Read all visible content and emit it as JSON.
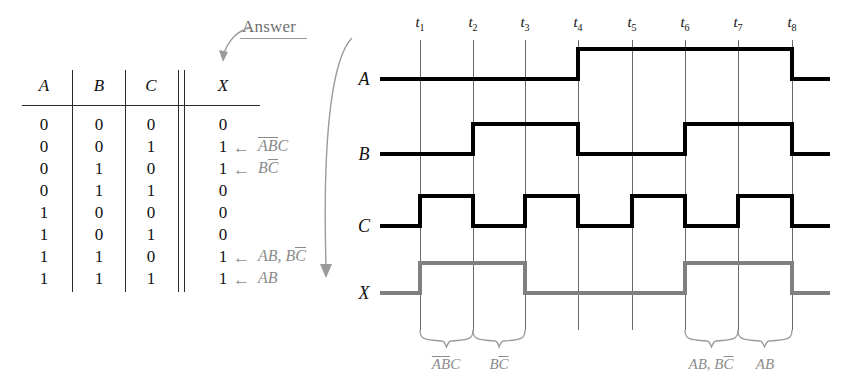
{
  "figure": {
    "kind": "truth-table-and-timing-diagram",
    "answer_callout": {
      "label": "Answer",
      "points_to": "X"
    }
  },
  "truth_table": {
    "columns": [
      "A",
      "B",
      "C",
      "X"
    ],
    "rows": [
      {
        "A": "0",
        "B": "0",
        "C": "0",
        "X": "0",
        "note": ""
      },
      {
        "A": "0",
        "B": "0",
        "C": "1",
        "X": "1",
        "note": "ABC",
        "note_overlines": [
          true,
          true,
          false
        ]
      },
      {
        "A": "0",
        "B": "1",
        "C": "0",
        "X": "1",
        "note": "BC",
        "note_overlines": [
          false,
          true
        ]
      },
      {
        "A": "0",
        "B": "1",
        "C": "1",
        "X": "0",
        "note": ""
      },
      {
        "A": "1",
        "B": "0",
        "C": "0",
        "X": "0",
        "note": ""
      },
      {
        "A": "1",
        "B": "0",
        "C": "1",
        "X": "0",
        "note": ""
      },
      {
        "A": "1",
        "B": "1",
        "C": "0",
        "X": "1",
        "note": "AB, BC",
        "note_overlines": [
          false,
          false,
          false,
          false,
          true
        ]
      },
      {
        "A": "1",
        "B": "1",
        "C": "1",
        "X": "1",
        "note": "AB",
        "note_overlines": [
          false,
          false
        ]
      }
    ],
    "arrow_glyph": "←"
  },
  "timing": {
    "time_markers": [
      "t1",
      "t2",
      "t3",
      "t4",
      "t5",
      "t6",
      "t7",
      "t8"
    ],
    "time_marker_base": "t",
    "time_marker_subs": [
      "1",
      "2",
      "3",
      "4",
      "5",
      "6",
      "7",
      "8"
    ],
    "signals": [
      {
        "name": "A",
        "color": "#000000",
        "levels": [
          0,
          0,
          0,
          1,
          1,
          1,
          1,
          1,
          0
        ]
      },
      {
        "name": "B",
        "color": "#000000",
        "levels": [
          0,
          0,
          1,
          1,
          0,
          0,
          1,
          1,
          0
        ]
      },
      {
        "name": "C",
        "color": "#000000",
        "levels": [
          0,
          1,
          0,
          1,
          0,
          1,
          0,
          1,
          0
        ]
      },
      {
        "name": "X",
        "color": "#808080",
        "levels": [
          0,
          1,
          1,
          0,
          0,
          0,
          1,
          1,
          0
        ]
      }
    ],
    "braces": [
      {
        "label": "ABC",
        "from": "t1",
        "to": "t2",
        "overlines": [
          true,
          true,
          false
        ]
      },
      {
        "label": "BC",
        "from": "t2",
        "to": "t3",
        "overlines": [
          false,
          true
        ]
      },
      {
        "label": "AB, BC",
        "from": "t6",
        "to": "t7",
        "overlines": [
          false,
          false,
          false,
          false,
          true
        ]
      },
      {
        "label": "AB",
        "from": "t7",
        "to": "t8",
        "overlines": [
          false,
          false
        ]
      }
    ]
  },
  "colors": {
    "signal_black": "#000000",
    "signal_gray": "#808080",
    "annotation_gray": "#8b8b8b",
    "grid_gray": "#6a6a6a",
    "background": "#ffffff"
  }
}
